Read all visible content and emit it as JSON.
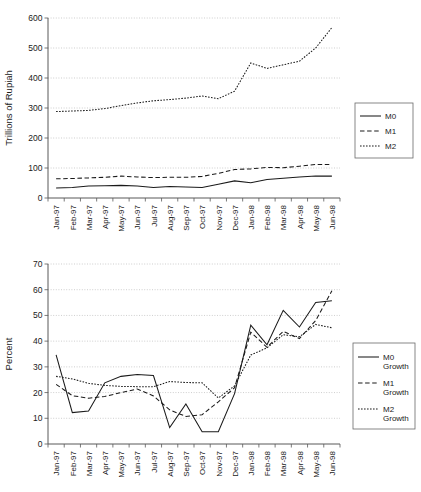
{
  "chart_data": [
    {
      "id": "levels",
      "type": "line",
      "title": "",
      "xlabel": "",
      "ylabel": "Trillions of Rupiah",
      "ylim": [
        0,
        600
      ],
      "ytick_labels": [
        "0",
        "100",
        "200",
        "300",
        "400",
        "500",
        "600"
      ],
      "yticks": [
        0,
        100,
        200,
        300,
        400,
        500,
        600
      ],
      "grid": true,
      "legend_position": "right",
      "categories": [
        "Jan-97",
        "Feb-97",
        "Mar-97",
        "Apr-97",
        "May-97",
        "Jun-97",
        "Jul-97",
        "Aug-97",
        "Sep-97",
        "Oct-97",
        "Nov-97",
        "Dec-97",
        "Jan-98",
        "Feb-98",
        "Mar-98",
        "Apr-98",
        "May-98",
        "Jun-98"
      ],
      "series": [
        {
          "name": "M0",
          "style": "solid",
          "values": [
            33,
            35,
            40,
            41,
            42,
            40,
            35,
            38,
            37,
            35,
            46,
            57,
            51,
            62,
            66,
            70,
            73,
            73
          ]
        },
        {
          "name": "M1",
          "style": "dashed",
          "values": [
            64,
            65,
            67,
            69,
            73,
            70,
            68,
            69,
            69,
            72,
            82,
            95,
            97,
            102,
            101,
            106,
            112,
            112
          ]
        },
        {
          "name": "M2",
          "style": "dotted",
          "values": [
            288,
            290,
            292,
            298,
            308,
            317,
            324,
            328,
            333,
            340,
            331,
            356,
            450,
            432,
            444,
            456,
            500,
            568
          ]
        }
      ]
    },
    {
      "id": "growth",
      "type": "line",
      "title": "",
      "xlabel": "",
      "ylabel": "Percent",
      "ylim": [
        0,
        70
      ],
      "ytick_labels": [
        "0",
        "10",
        "20",
        "30",
        "40",
        "50",
        "60",
        "70"
      ],
      "yticks": [
        0,
        10,
        20,
        30,
        40,
        50,
        60,
        70
      ],
      "grid": true,
      "legend_position": "right",
      "categories": [
        "Jan-97",
        "Feb-97",
        "Mar-97",
        "Apr-97",
        "May-97",
        "Jun-97",
        "Jul-97",
        "Aug-97",
        "Sep-97",
        "Oct-97",
        "Nov-97",
        "Dec-97",
        "Jan-98",
        "Feb-98",
        "Mar-98",
        "Apr-98",
        "May-98",
        "Jun-98"
      ],
      "series": [
        {
          "name": "M0 Growth",
          "style": "solid",
          "values": [
            34.7,
            12.2,
            12.8,
            23.8,
            26.3,
            27.0,
            26.6,
            6.4,
            15.6,
            4.8,
            4.8,
            19.6,
            46.2,
            38.6,
            52.0,
            45.5,
            55.0,
            55.7
          ]
        },
        {
          "name": "M1 Growth",
          "style": "dashed",
          "values": [
            23.2,
            18.8,
            17.8,
            18.5,
            20.0,
            21.4,
            18.7,
            13.3,
            10.7,
            11.4,
            16.4,
            21.9,
            43.5,
            37.6,
            43.8,
            41.0,
            48.0,
            59.6
          ]
        },
        {
          "name": "M2 Growth",
          "style": "dotted",
          "values": [
            26.3,
            25.3,
            23.6,
            22.8,
            22.4,
            22.3,
            22.3,
            24.3,
            23.9,
            23.8,
            17.9,
            22.6,
            34.6,
            37.4,
            42.5,
            41.7,
            46.5,
            45.2
          ]
        }
      ]
    }
  ],
  "levels_chart": {
    "ylabel": "Trillions of Rupiah",
    "ytick_labels": [
      "0",
      "100",
      "200",
      "300",
      "400",
      "500",
      "600"
    ],
    "xtick_labels": [
      "Jan-97",
      "Feb-97",
      "Mar-97",
      "Apr-97",
      "May-97",
      "Jun-97",
      "Jul-97",
      "Aug-97",
      "Sep-97",
      "Oct-97",
      "Nov-97",
      "Dec-97",
      "Jan-98",
      "Feb-98",
      "Mar-98",
      "Apr-98",
      "May-98",
      "Jun-98"
    ],
    "legend": [
      {
        "label": "M0"
      },
      {
        "label": "M1"
      },
      {
        "label": "M2"
      }
    ]
  },
  "growth_chart": {
    "ylabel": "Percent",
    "ytick_labels": [
      "0",
      "10",
      "20",
      "30",
      "40",
      "50",
      "60",
      "70"
    ],
    "xtick_labels": [
      "Jan-97",
      "Feb-97",
      "Mar-97",
      "Apr-97",
      "May-97",
      "Jun-97",
      "Jul-97",
      "Aug-97",
      "Sep-97",
      "Oct-97",
      "Nov-97",
      "Dec-97",
      "Jan-98",
      "Feb-98",
      "Mar-98",
      "Apr-98",
      "May-98",
      "Jun-98"
    ],
    "legend": [
      {
        "label_line1": "M0",
        "label_line2": "Growth"
      },
      {
        "label_line1": "M1",
        "label_line2": "Growth"
      },
      {
        "label_line1": "M2",
        "label_line2": "Growth"
      }
    ]
  }
}
